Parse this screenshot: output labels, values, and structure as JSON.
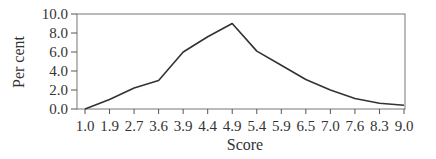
{
  "chart_data": {
    "type": "line",
    "title": "",
    "xlabel": "Score",
    "ylabel": "Per cent",
    "categories": [
      "1.0",
      "1.9",
      "2.7",
      "3.6",
      "3.9",
      "4.4",
      "4.9",
      "5.4",
      "5.9",
      "6.5",
      "7.0",
      "7.6",
      "8.3",
      "9.0"
    ],
    "series": [
      {
        "name": "Per cent",
        "values": [
          0.0,
          1.0,
          2.2,
          3.0,
          6.0,
          7.6,
          9.0,
          6.1,
          4.6,
          3.1,
          2.0,
          1.1,
          0.6,
          0.4
        ]
      }
    ],
    "yticks": [
      "0.0",
      "2.0",
      "4.0",
      "6.0",
      "8.0",
      "10.0"
    ],
    "ylim": [
      0,
      10
    ],
    "grid": false,
    "legend": "none",
    "line_color": "#333333"
  }
}
